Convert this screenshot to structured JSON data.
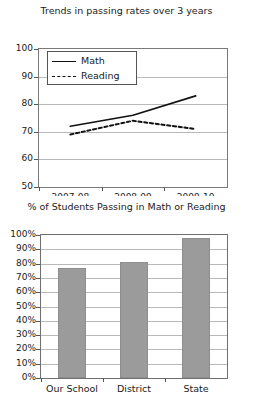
{
  "chart_data": [
    {
      "type": "line",
      "title": "Trends in passing rates over 3 years",
      "xlabel": "",
      "ylabel": "",
      "categories": [
        "2007-08",
        "2008-09",
        "2009-10"
      ],
      "ylim": [
        50,
        100
      ],
      "yticks": [
        50,
        60,
        70,
        80,
        90,
        100
      ],
      "ytick_labels": [
        "50",
        "60",
        "70",
        "80",
        "90",
        "100"
      ],
      "grid": true,
      "legend_position": "upper left",
      "series": [
        {
          "name": "Math",
          "values": [
            72,
            76,
            83
          ],
          "style": "solid"
        },
        {
          "name": "Reading",
          "values": [
            69,
            74,
            71
          ],
          "style": "dashed"
        }
      ]
    },
    {
      "type": "bar",
      "title": "% of Students Passing in Math or Reading",
      "xlabel": "",
      "ylabel": "",
      "categories": [
        "Our School",
        "District",
        "State"
      ],
      "values": [
        77,
        81,
        98
      ],
      "ylim": [
        0,
        100
      ],
      "yticks": [
        0,
        10,
        20,
        30,
        40,
        50,
        60,
        70,
        80,
        90,
        100
      ],
      "ytick_labels": [
        "0%",
        "10%",
        "20%",
        "30%",
        "40%",
        "50%",
        "60%",
        "70%",
        "80%",
        "90%",
        "100%"
      ],
      "grid": true,
      "bar_color": "#9b9b9b"
    }
  ]
}
